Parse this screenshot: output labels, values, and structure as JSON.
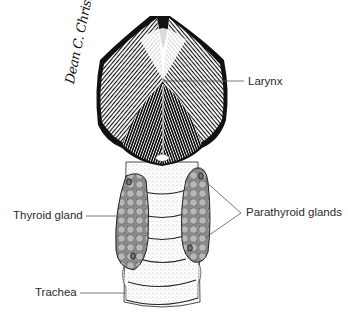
{
  "figure": {
    "type": "anatomical-illustration",
    "colors": {
      "ink": "#111111",
      "stipple": "#9a9a9a",
      "gland_fill": "#a8a8a8",
      "label_text": "#2a2a2a",
      "leader_line": "#555555",
      "background": "#ffffff"
    }
  },
  "labels": {
    "larynx": "Larynx",
    "thyroid": "Thyroid gland",
    "parathyroid": "Parathyroid glands",
    "trachea": "Trachea"
  },
  "signature": {
    "text": "Dean C. Christmann"
  }
}
